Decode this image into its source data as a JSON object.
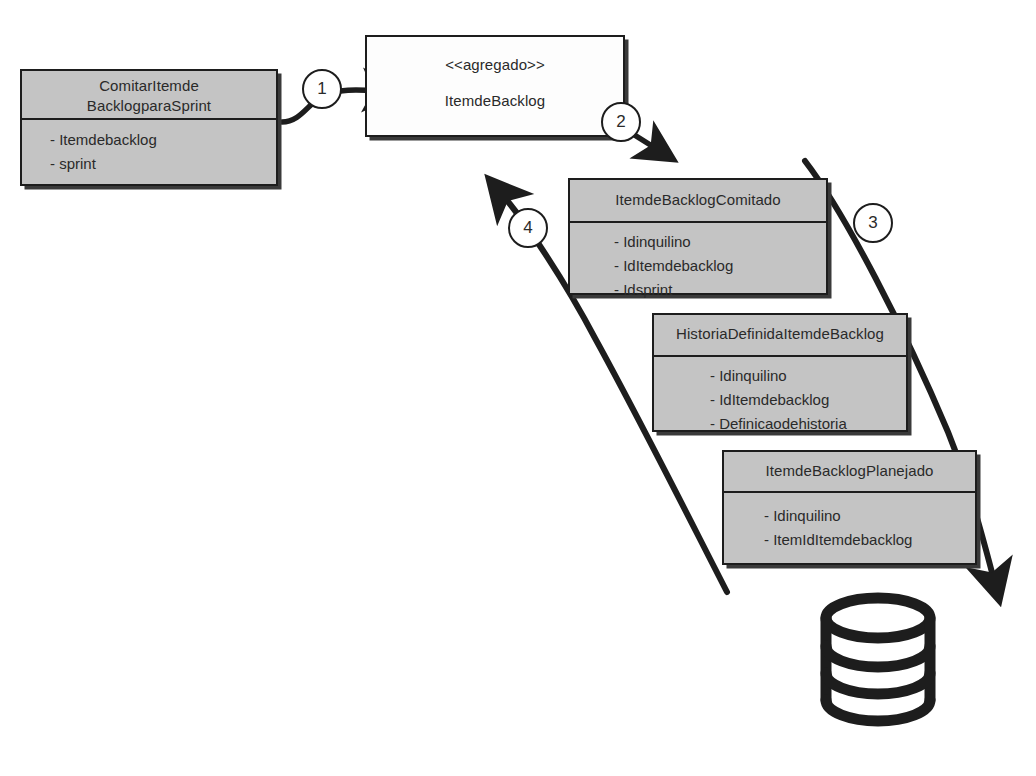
{
  "diagram": {
    "background_color": "#ffffff",
    "box_fill": "#c4c4c4",
    "box_plain_fill": "#fdfdfd",
    "line_color": "#1d1d1d",
    "text_color": "#2a2a2a"
  },
  "boxes": [
    {
      "id": "comitar-item-de-backlog-para-sprint",
      "header_lines": [
        "ComitarItemde",
        "BacklogparaSprint"
      ],
      "attributes": [
        "- Itemdebacklog",
        "- sprint"
      ],
      "filled": true,
      "divided": true
    },
    {
      "id": "item-de-backlog-agregado",
      "stereotype": "<<agregado>>",
      "header_lines": [
        "ItemdeBacklog"
      ],
      "attributes": [],
      "filled": false,
      "divided": false
    },
    {
      "id": "item-de-backlog-comitado",
      "header_lines": [
        "ItemdeBacklogComitado"
      ],
      "attributes": [
        "- Idinquilino",
        "- IdItemdebacklog",
        "- Idsprint"
      ],
      "filled": true,
      "divided": true
    },
    {
      "id": "historia-definida-item-de-backlog",
      "header_lines": [
        "HistoriaDefinidaItemdeBacklog"
      ],
      "attributes": [
        "- Idinquilino",
        "- IdItemdebacklog",
        "- Definicaodehistoria"
      ],
      "filled": true,
      "divided": true
    },
    {
      "id": "item-de-backlog-planejado",
      "header_lines": [
        "ItemdeBacklogPlanejado"
      ],
      "attributes": [
        "- Idinquilino",
        "- ItemIdItemdebacklog"
      ],
      "filled": true,
      "divided": true
    }
  ],
  "steps": [
    {
      "label": "1"
    },
    {
      "label": "2"
    },
    {
      "label": "3"
    },
    {
      "label": "4"
    }
  ],
  "datastore": {
    "id": "database-cylinder",
    "bands": 3
  }
}
